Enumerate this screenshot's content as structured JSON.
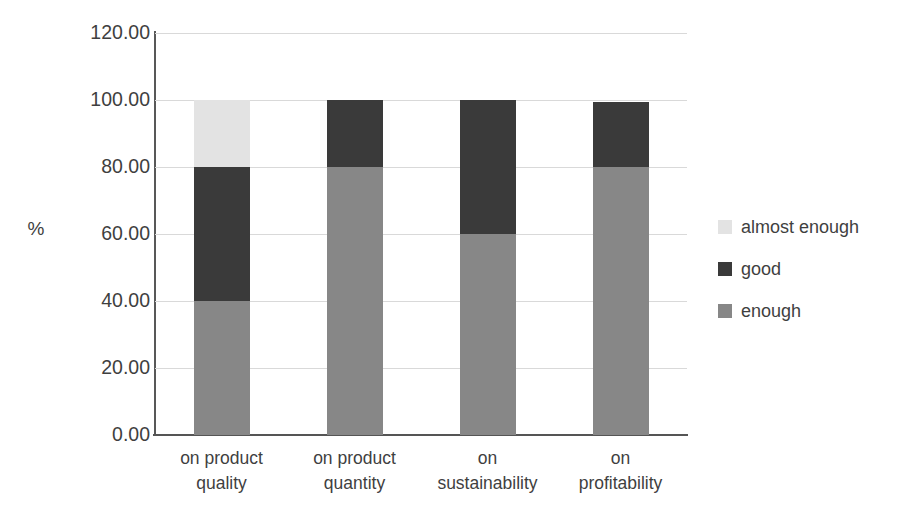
{
  "chart_data": {
    "type": "bar",
    "subtype": "stacked-column-100",
    "title": "",
    "xlabel": "",
    "ylabel": "%",
    "ylim": [
      0,
      120
    ],
    "ytick_step": 20,
    "ytick_labels": [
      "0.00",
      "20.00",
      "40.00",
      "60.00",
      "80.00",
      "100.00",
      "120.00"
    ],
    "ytick_values": [
      0,
      20,
      40,
      60,
      80,
      100,
      120
    ],
    "grid": true,
    "legend_position": "right",
    "categories": [
      "on product quality",
      "on product quantity",
      "on sustainability",
      "on profitability"
    ],
    "category_lines": [
      [
        "on product",
        "quality"
      ],
      [
        "on product",
        "quantity"
      ],
      [
        "on",
        "sustainability"
      ],
      [
        "on",
        "profitability"
      ]
    ],
    "series": [
      {
        "name": "enough",
        "color": "#878787",
        "values": [
          40.0,
          80.0,
          60.0,
          80.0
        ]
      },
      {
        "name": "good",
        "color": "#3a3a3a",
        "values": [
          40.0,
          20.0,
          40.0,
          19.5
        ]
      },
      {
        "name": "almost enough",
        "color": "#e3e3e3",
        "values": [
          20.0,
          0.0,
          0.0,
          0.0
        ]
      }
    ],
    "legend_entries": [
      {
        "label": "almost enough",
        "color": "#e3e3e3"
      },
      {
        "label": "good",
        "color": "#3a3a3a"
      },
      {
        "label": "enough",
        "color": "#878787"
      }
    ],
    "colors": {
      "enough": "#878787",
      "good": "#3a3a3a",
      "almost_enough": "#e3e3e3",
      "gridline": "#d9d9d9",
      "axis": "#555555",
      "text": "#3f3f3f",
      "background": "#ffffff"
    }
  }
}
